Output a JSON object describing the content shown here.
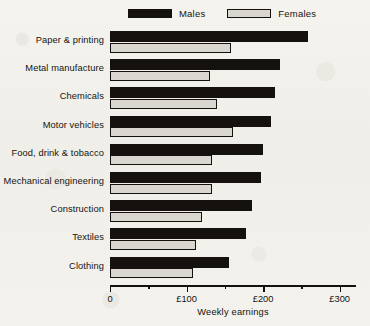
{
  "chart_data": {
    "type": "bar",
    "orientation": "horizontal",
    "title": "",
    "xlabel": "Weekly earnings",
    "ylabel": "",
    "xlim": [
      0,
      320
    ],
    "grid": false,
    "legend_position": "top",
    "categories": [
      "Paper & printing",
      "Metal manufacture",
      "Chemicals",
      "Motor vehicles",
      "Food, drink & tobacco",
      "Mechanical engineering",
      "Construction",
      "Textiles",
      "Clothing"
    ],
    "series": [
      {
        "name": "Males",
        "color": "#14110e",
        "values": [
          258,
          222,
          216,
          210,
          200,
          197,
          185,
          178,
          155
        ]
      },
      {
        "name": "Females",
        "color": "#d9d7d0",
        "values": [
          158,
          130,
          140,
          160,
          133,
          133,
          120,
          112,
          108
        ]
      }
    ],
    "xticks": [
      {
        "value": 0,
        "label": "0"
      },
      {
        "value": 50,
        "label": ""
      },
      {
        "value": 100,
        "label": "£100"
      },
      {
        "value": 150,
        "label": ""
      },
      {
        "value": 200,
        "label": "£200"
      },
      {
        "value": 250,
        "label": ""
      },
      {
        "value": 300,
        "label": "£300"
      }
    ]
  },
  "legend": {
    "items": [
      {
        "label": "Males"
      },
      {
        "label": "Females"
      }
    ]
  },
  "colors": {
    "ink": "#14110e",
    "paper": "#f2f1ec",
    "female_fill": "#d9d7d0"
  }
}
